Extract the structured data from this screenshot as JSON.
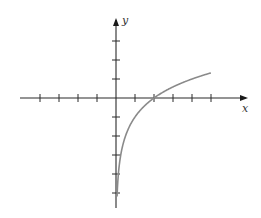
{
  "chart_data": {
    "type": "line",
    "title": "",
    "xlabel": "x",
    "ylabel": "y",
    "grid": false,
    "legend": null,
    "xlim": [
      -5,
      5.5
    ],
    "ylim": [
      -5.5,
      4
    ],
    "x_ticks": [
      -4,
      -3,
      -2,
      -1,
      1,
      2,
      3,
      4,
      5
    ],
    "y_ticks": [
      -5,
      -4,
      -3,
      -2,
      -1,
      1,
      2,
      3
    ],
    "series": [
      {
        "name": "y = log2(x) - 1",
        "x": [
          0.06,
          0.1,
          0.15,
          0.25,
          0.5,
          0.75,
          1,
          1.5,
          2,
          2.5,
          3,
          3.5,
          4,
          4.5,
          5
        ],
        "y": [
          -5.06,
          -4.32,
          -3.74,
          -3.0,
          -2.0,
          -1.42,
          -1.0,
          -0.42,
          0.0,
          0.32,
          0.58,
          0.81,
          1.0,
          1.17,
          1.32
        ]
      }
    ],
    "annotations": [
      "x-intercept at x = 2"
    ]
  },
  "labels": {
    "x": "x",
    "y": "y"
  }
}
